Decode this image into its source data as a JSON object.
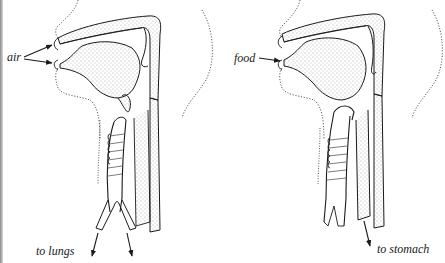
{
  "diagram": {
    "type": "anatomical-cross-section",
    "panels": [
      {
        "id": "breathing",
        "description": "Sagittal section of head and throat showing the path of air",
        "labels": {
          "input": "air",
          "output": "to lungs"
        },
        "input_arrows": 2,
        "output_arrows": 2
      },
      {
        "id": "swallowing",
        "description": "Sagittal section of head and throat showing the path of food",
        "labels": {
          "input": "food",
          "output": "to stomach"
        },
        "input_arrows": 1,
        "output_arrows": 1
      }
    ],
    "colors": {
      "ink": "#1a1a1a",
      "stipple": "#555555",
      "background": "#ffffff",
      "edge_shadow": "#8a8a8a"
    }
  }
}
